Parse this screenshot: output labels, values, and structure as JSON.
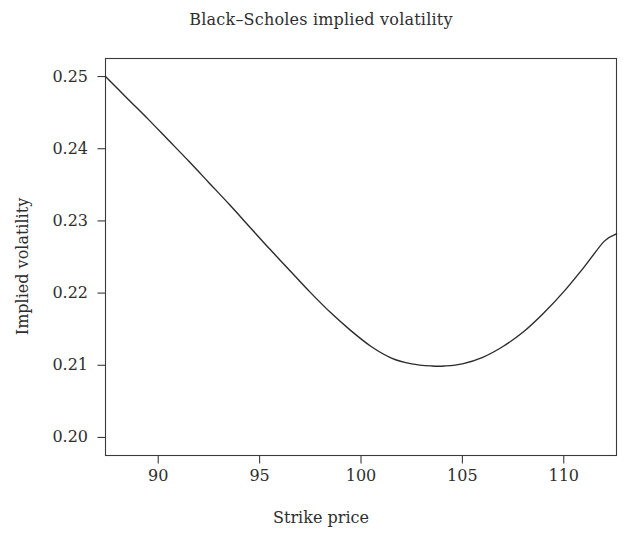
{
  "chart_data": {
    "type": "line",
    "title": "Black–Scholes implied volatility",
    "xlabel": "Strike price",
    "ylabel": "Implied volatility",
    "grid": false,
    "legend": null,
    "line_color": "#2b2b2b",
    "line_width": 1.4,
    "xlim": [
      87.4,
      112.6
    ],
    "ylim": [
      0.1975,
      0.2525
    ],
    "xticks": [
      90,
      95,
      100,
      105,
      110
    ],
    "xtick_labels": [
      "90",
      "95",
      "100",
      "105",
      "110"
    ],
    "yticks": [
      0.2,
      0.21,
      0.22,
      0.23,
      0.24,
      0.25
    ],
    "ytick_labels": [
      "0.20",
      "0.21",
      "0.22",
      "0.23",
      "0.24",
      "0.25"
    ],
    "series": [
      {
        "name": "implied volatility",
        "x": [
          87.4,
          88.5,
          89.5,
          90.5,
          91.5,
          92.5,
          93.5,
          94.5,
          95.5,
          96.5,
          97.5,
          98.5,
          99.5,
          100.5,
          101.5,
          102.5,
          103.5,
          104.1,
          105.0,
          106.0,
          107.0,
          108.0,
          109.0,
          110.0,
          111.0,
          112.0,
          112.6
        ],
        "y": [
          0.25,
          0.2469,
          0.2441,
          0.2412,
          0.2383,
          0.2353,
          0.2323,
          0.2292,
          0.2261,
          0.2231,
          0.2201,
          0.2173,
          0.2148,
          0.2126,
          0.211,
          0.2102,
          0.2099,
          0.2099,
          0.2102,
          0.2111,
          0.2126,
          0.2146,
          0.2172,
          0.2202,
          0.2236,
          0.2272,
          0.2282
        ]
      }
    ],
    "annotations": []
  },
  "figure": {
    "background": "#ffffff",
    "axes_color": "#3a3a3a",
    "text_color": "#2e2e2e"
  }
}
